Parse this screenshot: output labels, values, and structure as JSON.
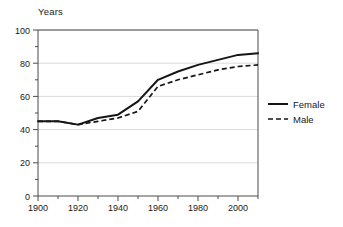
{
  "chart_data": {
    "type": "line",
    "title": "",
    "ylabel": "Years",
    "xlabel": "",
    "xlim": [
      1900,
      2010
    ],
    "ylim": [
      0,
      100
    ],
    "grid": true,
    "grid_axis": "y",
    "legend_position": "right-outside",
    "y_ticks": [
      0,
      20,
      40,
      60,
      80,
      100
    ],
    "y_tick_labels": [
      "0",
      "20",
      "40",
      "60",
      "80",
      "100"
    ],
    "y_minor_ticks": [
      10,
      30,
      50,
      70,
      90
    ],
    "x_ticks": [
      1900,
      1920,
      1940,
      1960,
      1980,
      2000
    ],
    "x_tick_labels": [
      "1900",
      "1920",
      "1940",
      "1960",
      "1980",
      "2000"
    ],
    "x_minor_ticks": [
      1910,
      1930,
      1950,
      1970,
      1990,
      2010
    ],
    "x": [
      1900,
      1910,
      1920,
      1930,
      1940,
      1950,
      1960,
      1970,
      1980,
      1990,
      2000,
      2010
    ],
    "series": [
      {
        "name": "Female",
        "style": "solid",
        "color": "#151515",
        "values": [
          45,
          45,
          43,
          47,
          49,
          57,
          70,
          75,
          79,
          82,
          85,
          86
        ]
      },
      {
        "name": "Male",
        "style": "dashed",
        "color": "#151515",
        "values": [
          45,
          45,
          43,
          45,
          47,
          51,
          66,
          70,
          73,
          76,
          78,
          79
        ]
      }
    ]
  },
  "legend": {
    "entries": [
      {
        "label": "Female"
      },
      {
        "label": "Male"
      }
    ]
  }
}
